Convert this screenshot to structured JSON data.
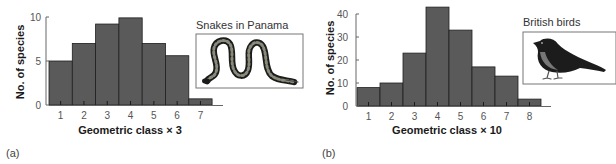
{
  "chart_data": [
    {
      "type": "bar",
      "panel_label": "(a)",
      "title": "",
      "inset_title": "Snakes in Panama",
      "inset_icon": "snake-illustration",
      "categories": [
        "1",
        "2",
        "3",
        "4",
        "5",
        "6",
        "7"
      ],
      "values": [
        5,
        7,
        9.2,
        9.9,
        7,
        5.6,
        0.7
      ],
      "xlabel": "Geometric class × 3",
      "ylabel": "No. of species",
      "ylim": [
        0,
        10
      ],
      "yticks": [
        0,
        5,
        10
      ],
      "grid": false,
      "bar_color": "#5a5a5a"
    },
    {
      "type": "bar",
      "panel_label": "(b)",
      "title": "",
      "inset_title": "British birds",
      "inset_icon": "bird-illustration",
      "categories": [
        "1",
        "2",
        "3",
        "4",
        "5",
        "6",
        "7",
        "8"
      ],
      "values": [
        8,
        10,
        23,
        43,
        33,
        17,
        13,
        3
      ],
      "xlabel": "Geometric class × 10",
      "ylabel": "No. of species",
      "ylim": [
        0,
        40
      ],
      "yticks": [
        0,
        10,
        20,
        30,
        40
      ],
      "grid": false,
      "bar_color": "#5a5a5a"
    }
  ]
}
